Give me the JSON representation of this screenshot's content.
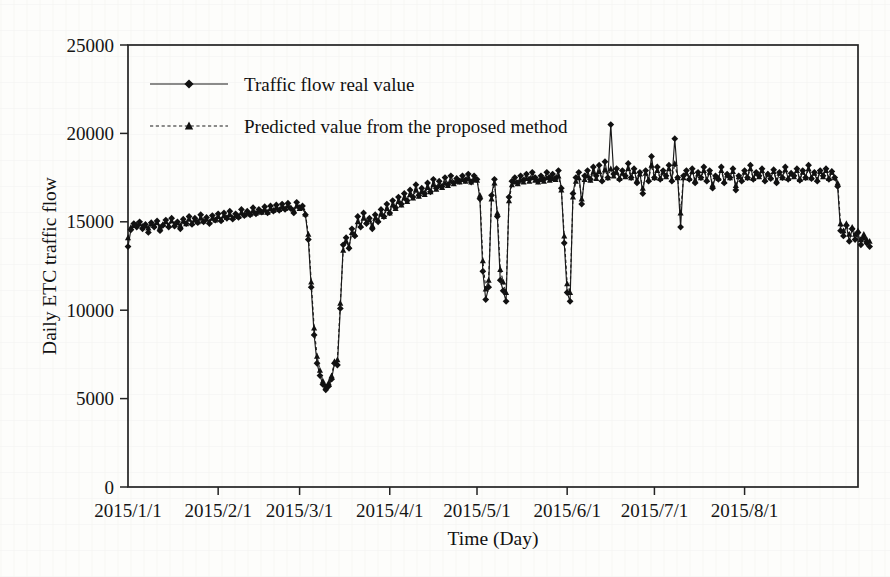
{
  "figure": {
    "background_color": "#fdfdfb",
    "ink_color": "#1a1a1a"
  },
  "chart_data": {
    "type": "line",
    "title": "",
    "xlabel": "Time (Day)",
    "ylabel": "Daily ETC traffic flow",
    "grid": false,
    "legend_position": "top-left-inside",
    "ylim": [
      0,
      25000
    ],
    "yticks": [
      0,
      5000,
      10000,
      15000,
      20000,
      25000
    ],
    "ytick_labels": [
      "0",
      "5000",
      "10000",
      "15000",
      "20000",
      "25000"
    ],
    "xtick_labels": [
      "2015/1/1",
      "2015/2/1",
      "2015/3/1",
      "2015/4/1",
      "2015/5/1",
      "2015/6/1",
      "2015/7/1",
      "2015/8/1"
    ],
    "xtick_day_index": [
      0,
      31,
      59,
      90,
      120,
      151,
      181,
      212
    ],
    "xlim_days": [
      0,
      251
    ],
    "x_unit": "day index from 2015/1/1",
    "series": [
      {
        "name": "Traffic flow real value",
        "marker": "diamond",
        "linestyle": "solid",
        "color": "#1a1a1a",
        "values": [
          13600,
          14550,
          14900,
          14700,
          15000,
          14600,
          14850,
          14400,
          14950,
          14700,
          15050,
          14500,
          14800,
          15100,
          14700,
          15200,
          14750,
          15000,
          14600,
          15150,
          14900,
          15300,
          14850,
          15200,
          14950,
          15400,
          15000,
          15250,
          14900,
          15350,
          15100,
          15450,
          15050,
          15500,
          15200,
          15600,
          15150,
          15450,
          15250,
          15700,
          15350,
          15600,
          15400,
          15800,
          15450,
          15700,
          15550,
          15850,
          15500,
          15900,
          15600,
          15950,
          15650,
          16000,
          15700,
          16050,
          15750,
          15500,
          16100,
          15800,
          15900,
          15400,
          14000,
          11300,
          8600,
          7000,
          6300,
          5800,
          5500,
          5700,
          6100,
          7000,
          6900,
          10100,
          13700,
          14100,
          13500,
          14600,
          14200,
          15300,
          14700,
          15500,
          14900,
          15200,
          14600,
          15400,
          15000,
          15700,
          15300,
          16000,
          15500,
          16200,
          15800,
          16400,
          16000,
          16600,
          16200,
          16800,
          16400,
          17100,
          16500,
          16900,
          16600,
          17200,
          16700,
          17400,
          16900,
          17300,
          17000,
          17500,
          17100,
          17600,
          17200,
          17450,
          17300,
          17600,
          17350,
          17700,
          17250,
          17600,
          17400,
          16300,
          12200,
          10600,
          11300,
          16500,
          17400,
          15300,
          11700,
          11100,
          10500,
          16400,
          17300,
          17500,
          17200,
          17600,
          17350,
          17700,
          17400,
          17800,
          17500,
          17300,
          17600,
          17400,
          17800,
          17500,
          17700,
          17450,
          17900,
          16900,
          13800,
          11000,
          10500,
          16600,
          17500,
          17800,
          16000,
          17600,
          17900,
          17400,
          18100,
          17600,
          18200,
          17300,
          18400,
          17500,
          20500,
          17700,
          18000,
          17400,
          17900,
          17600,
          18300,
          17500,
          18000,
          17200,
          17800,
          16600,
          17900,
          17300,
          18700,
          17500,
          18100,
          17400,
          17900,
          17600,
          18200,
          17300,
          19700,
          17500,
          14700,
          17600,
          17900,
          17400,
          18000,
          17200,
          17800,
          17500,
          18100,
          17300,
          17900,
          16900,
          17600,
          17400,
          18100,
          17200,
          17700,
          17500,
          18000,
          16800,
          17600,
          17300,
          17900,
          17500,
          18200,
          17400,
          17800,
          17600,
          18000,
          17300,
          17700,
          17450,
          17950,
          17200,
          17800,
          17500,
          18100,
          17400,
          17750,
          17600,
          18000,
          17350,
          17900,
          17500,
          18200,
          17450,
          17800,
          17300,
          17900,
          17600,
          18000,
          17400,
          17850,
          17500,
          17000,
          14500,
          14200,
          14800,
          13900,
          14600,
          14000,
          14400,
          13700,
          14100,
          13800,
          13600
        ]
      },
      {
        "name": "Predicted value from the proposed method",
        "marker": "triangle",
        "linestyle": "dashed",
        "color": "#1a1a1a",
        "values": [
          14100,
          14700,
          14800,
          14850,
          14900,
          14750,
          14800,
          14650,
          14900,
          14800,
          14950,
          14700,
          14850,
          15000,
          14800,
          15050,
          14850,
          14950,
          14800,
          15050,
          14900,
          15150,
          14950,
          15100,
          15000,
          15200,
          15050,
          15150,
          15000,
          15200,
          15100,
          15300,
          15150,
          15350,
          15250,
          15400,
          15250,
          15350,
          15300,
          15500,
          15400,
          15500,
          15450,
          15600,
          15500,
          15600,
          15550,
          15700,
          15550,
          15750,
          15650,
          15800,
          15700,
          15850,
          15750,
          15900,
          15800,
          15650,
          15900,
          15750,
          15800,
          15450,
          14300,
          11600,
          9000,
          7400,
          6600,
          6000,
          5700,
          5900,
          6300,
          7100,
          7200,
          10400,
          13400,
          13900,
          13600,
          14400,
          14300,
          15000,
          14800,
          15200,
          15000,
          15100,
          14800,
          15200,
          15100,
          15450,
          15300,
          15750,
          15500,
          15950,
          15750,
          16150,
          15950,
          16350,
          16150,
          16550,
          16350,
          16800,
          16450,
          16700,
          16550,
          16950,
          16700,
          17100,
          16850,
          17050,
          16950,
          17200,
          17050,
          17300,
          17150,
          17300,
          17250,
          17400,
          17300,
          17450,
          17250,
          17400,
          17350,
          16500,
          12800,
          11200,
          11700,
          16300,
          17200,
          15500,
          12300,
          11600,
          11000,
          16200,
          17100,
          17250,
          17150,
          17350,
          17250,
          17450,
          17300,
          17500,
          17350,
          17250,
          17400,
          17300,
          17500,
          17350,
          17450,
          17400,
          17600,
          16800,
          14200,
          11500,
          11000,
          16400,
          17300,
          17500,
          16300,
          17400,
          17600,
          17350,
          17800,
          17450,
          17850,
          17400,
          17950,
          17500,
          18000,
          17600,
          17800,
          17450,
          17750,
          17550,
          18000,
          17500,
          17850,
          17350,
          17700,
          16900,
          17750,
          17400,
          18200,
          17500,
          17900,
          17450,
          17800,
          17550,
          18000,
          17400,
          18300,
          17500,
          15500,
          17500,
          17750,
          17450,
          17850,
          17350,
          17700,
          17500,
          17900,
          17400,
          17800,
          17100,
          17550,
          17450,
          17900,
          17300,
          17650,
          17500,
          17850,
          17050,
          17550,
          17400,
          17800,
          17500,
          18000,
          17450,
          17750,
          17550,
          17900,
          17400,
          17700,
          17500,
          17850,
          17350,
          17750,
          17500,
          17950,
          17450,
          17700,
          17550,
          17900,
          17400,
          17800,
          17500,
          18000,
          17500,
          17750,
          17400,
          17850,
          17550,
          17900,
          17450,
          17800,
          17500,
          17200,
          14900,
          14500,
          14900,
          14300,
          14700,
          14300,
          14500,
          14000,
          14300,
          14000,
          13900
        ]
      }
    ]
  },
  "legend": {
    "items": [
      {
        "label": "Traffic flow real value",
        "marker": "diamond",
        "linestyle": "solid"
      },
      {
        "label": "Predicted value from the proposed method",
        "marker": "triangle",
        "linestyle": "dashed"
      }
    ]
  }
}
